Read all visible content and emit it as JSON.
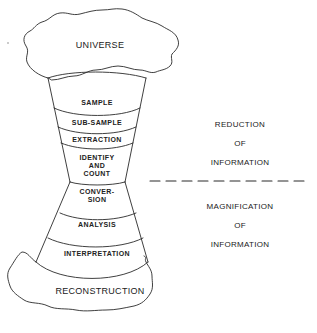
{
  "diagram": {
    "top_cloud": "UNIVERSE",
    "bottom_cloud": "RECONSTRUCTION",
    "stages": [
      {
        "label": "SAMPLE"
      },
      {
        "label": "SUB-SAMPLE"
      },
      {
        "label": "EXTRACTION"
      },
      {
        "label": "IDENTIFY\nAND\nCOUNT",
        "lines": [
          "IDENTIFY",
          "AND",
          "COUNT"
        ]
      },
      {
        "label": "CONVER-\nSION",
        "lines": [
          "CONVER-",
          "SION"
        ]
      },
      {
        "label": "ANALYSIS"
      },
      {
        "label": "INTERPRETATION"
      }
    ],
    "upper_annotation": {
      "lines": [
        "REDUCTION",
        "OF",
        "INFORMATION"
      ]
    },
    "lower_annotation": {
      "lines": [
        "MAGNIFICATION",
        "OF",
        "INFORMATION"
      ]
    },
    "divider": "dashed"
  }
}
